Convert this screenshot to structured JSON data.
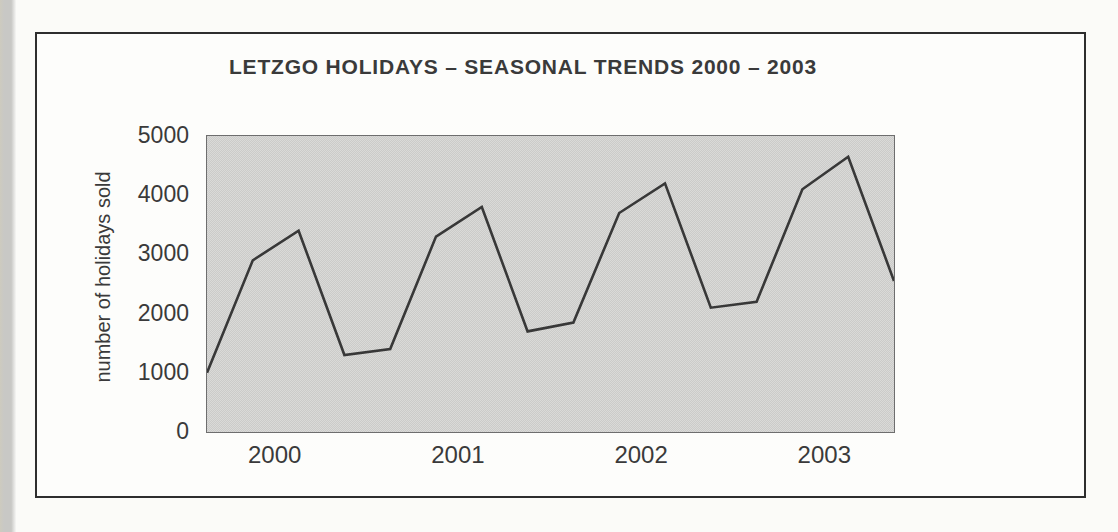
{
  "page": {
    "background_color": "#fbfbf8",
    "left_strip_color": "#c8c8c5"
  },
  "figure": {
    "border_color": "#2e2e2e",
    "background_color": "#fdfdfb"
  },
  "chart_data": {
    "type": "line",
    "title": "LETZGO HOLIDAYS – SEASONAL TRENDS 2000 – 2003",
    "xlabel": "",
    "ylabel": "number of holidays sold",
    "categories": [
      "2000 Q1",
      "2000 Q2",
      "2000 Q3",
      "2000 Q4",
      "2001 Q1",
      "2001 Q2",
      "2001 Q3",
      "2001 Q4",
      "2002 Q1",
      "2002 Q2",
      "2002 Q3",
      "2002 Q4",
      "2003 Q1",
      "2003 Q2",
      "2003 Q3",
      "2003 Q4"
    ],
    "values": [
      1000,
      2900,
      3400,
      1300,
      1400,
      3300,
      3800,
      1700,
      1850,
      3700,
      4200,
      2100,
      2200,
      4100,
      4650,
      2550
    ],
    "yticks": [
      0,
      1000,
      2000,
      3000,
      4000,
      5000
    ],
    "ylim": [
      0,
      5000
    ],
    "xtick_labels": [
      "2000",
      "2001",
      "2002",
      "2003"
    ],
    "grid": false,
    "legend": "none",
    "plot_background": "#d3d3d1",
    "line_color": "#383838",
    "text_color": "#3a3a3a"
  }
}
